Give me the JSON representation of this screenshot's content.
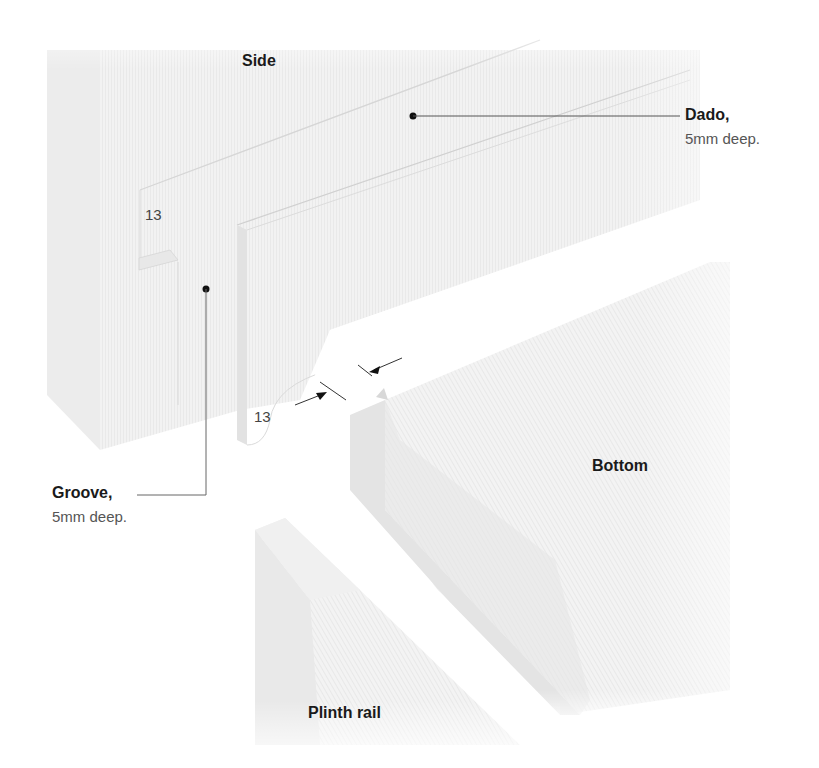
{
  "diagram": {
    "type": "joinery-exploded-view",
    "parts": {
      "side": {
        "label": "Side"
      },
      "bottom": {
        "label": "Bottom"
      },
      "plinth_rail": {
        "label": "Plinth rail"
      }
    },
    "callouts": {
      "dado": {
        "title": "Dado,",
        "detail": "5mm deep."
      },
      "groove": {
        "title": "Groove,",
        "detail": "5mm deep."
      }
    },
    "dimensions": {
      "groove_offset": "13",
      "gap": "13"
    },
    "colors": {
      "wood_light": "#f3f3f3",
      "wood_mid": "#ebebeb",
      "wood_shadow": "#e0e0e0",
      "leader_line": "#555555",
      "text": "#1a1a1a"
    }
  }
}
